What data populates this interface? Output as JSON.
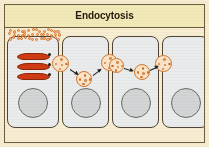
{
  "figure": {
    "title": "Endocytosis",
    "process_label": "Endocytosis",
    "colors": {
      "frame_border": "#6e5d3d",
      "title_background": "#f2e9b8",
      "title_text": "#241c0e",
      "stage_background": "#f6edd3",
      "cell_fill": "#e9ebec",
      "cell_border": "#4f4534",
      "nucleus_fill": "#d2d4d5",
      "nucleus_border": "#6a6a68",
      "golgi_fill": "#cf3b12",
      "golgi_border": "#8d2608",
      "vesicle_fill": "#fbe3c8",
      "vesicle_border": "#d0782d",
      "ligand_fill": "#f7b478",
      "ligand_border": "#d9762f",
      "arrow": "#20201c"
    }
  },
  "cells": [
    {
      "id": "cell-1",
      "label": "cell-1",
      "has_golgi": true,
      "has_nucleus": true
    },
    {
      "id": "cell-2",
      "label": "cell-2",
      "has_golgi": false,
      "has_nucleus": true
    },
    {
      "id": "cell-3",
      "label": "cell-3",
      "has_golgi": false,
      "has_nucleus": true
    },
    {
      "id": "cell-4",
      "label": "cell-4",
      "has_golgi": false,
      "has_nucleus": true
    }
  ],
  "organelles": {
    "golgi_stack_count": 3,
    "dark_receptor_dot_count": 3,
    "nucleus_count": 4
  },
  "ligand_cloud": {
    "name": "extracellular-ligand-cloud",
    "dot_count": 42
  },
  "vesicles": [
    {
      "id": "vesicle-1",
      "label": "membrane-bound-vesicle",
      "dots": 5
    },
    {
      "id": "vesicle-2",
      "label": "free-vesicle",
      "dots": 5
    },
    {
      "id": "vesicle-3",
      "label": "membrane-bound-vesicle",
      "dots": 5
    },
    {
      "id": "vesicle-4",
      "label": "membrane-bound-vesicle",
      "dots": 5
    },
    {
      "id": "vesicle-5",
      "label": "free-vesicle",
      "dots": 5
    },
    {
      "id": "vesicle-6",
      "label": "membrane-bound-vesicle",
      "dots": 5
    }
  ],
  "arrows": [
    {
      "id": "arrow-1",
      "label": "transport-arrow"
    },
    {
      "id": "arrow-2",
      "label": "transport-arrow"
    },
    {
      "id": "arrow-3",
      "label": "transport-arrow"
    },
    {
      "id": "arrow-4",
      "label": "transport-arrow"
    }
  ]
}
